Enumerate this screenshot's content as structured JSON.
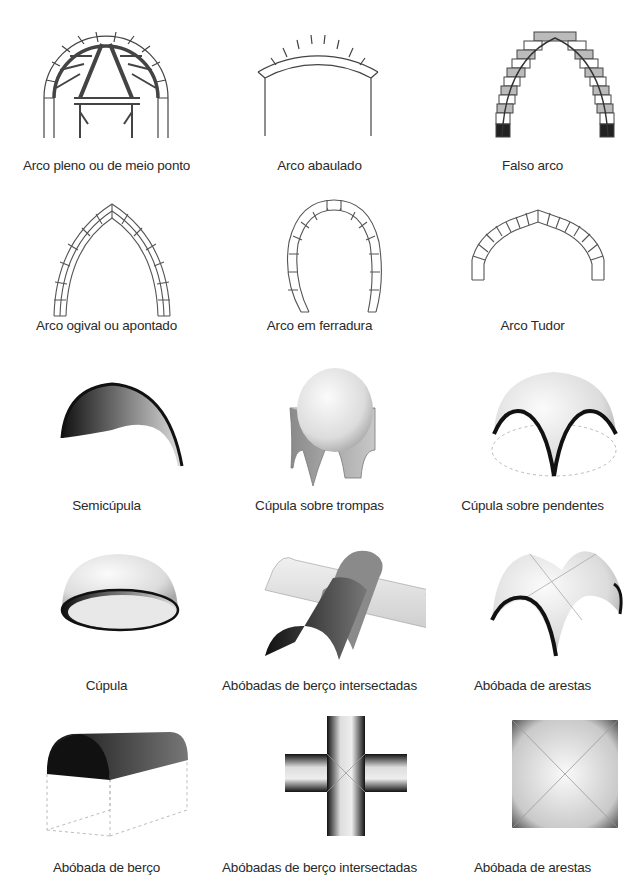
{
  "rows": [
    {
      "items": [
        {
          "label": "Arco pleno ou de meio ponto",
          "icon": "semicircular-arch-with-centering-icon"
        },
        {
          "label": "Arco abaulado",
          "icon": "segmental-arch-icon"
        },
        {
          "label": "Falso arco",
          "icon": "corbel-arch-icon"
        }
      ]
    },
    {
      "items": [
        {
          "label": "Arco ogival ou apontado",
          "icon": "pointed-arch-icon"
        },
        {
          "label": "Arco em ferradura",
          "icon": "horseshoe-arch-icon"
        },
        {
          "label": "Arco Tudor",
          "icon": "tudor-arch-icon"
        }
      ]
    },
    {
      "items": [
        {
          "label": "Semicúpula",
          "icon": "semidome-icon"
        },
        {
          "label": "Cúpula sobre trompas",
          "icon": "dome-on-squinches-icon"
        },
        {
          "label": "Cúpula sobre pendentes",
          "icon": "dome-on-pendentives-icon"
        }
      ]
    },
    {
      "items": [
        {
          "label": "Cúpula",
          "icon": "dome-icon"
        },
        {
          "label": "Abóbadas de berço intersectadas",
          "icon": "intersecting-barrel-vaults-icon"
        },
        {
          "label": "Abóbada de arestas",
          "icon": "groin-vault-icon"
        }
      ]
    },
    {
      "items": [
        {
          "label": "Abóbada de berço",
          "icon": "barrel-vault-icon"
        },
        {
          "label": "Abóbadas de berço intersectadas",
          "icon": "intersecting-barrel-vaults-plan-icon"
        },
        {
          "label": "Abóbada de arestas",
          "icon": "groin-vault-plan-icon"
        }
      ]
    }
  ]
}
